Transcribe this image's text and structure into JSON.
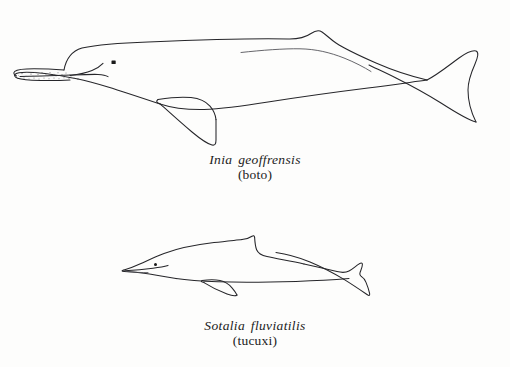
{
  "plate": {
    "background_color": "#fdfdfc",
    "ink_color": "#26262a",
    "figure_count": 2
  },
  "figures": [
    {
      "id": "boto",
      "scientific_name": "Inia geoffrensis",
      "common_name": "(boto)",
      "icon_name": "amazon-river-dolphin-side-profile",
      "features": [
        "long-narrow-beak",
        "stippled-rostrum-teeth",
        "melon-forehead",
        "small-eye",
        "large-paddle-flipper",
        "low-dorsal-ridge-hump",
        "broad-tail-fluke"
      ]
    },
    {
      "id": "tucuxi",
      "scientific_name": "Sotalia fluviatilis",
      "common_name": "(tucuxi)",
      "icon_name": "tucuxi-dolphin-side-profile",
      "features": [
        "short-beak",
        "small-eye",
        "falcate-triangular-dorsal-fin",
        "curved-flipper",
        "notched-tail-fluke"
      ]
    }
  ]
}
